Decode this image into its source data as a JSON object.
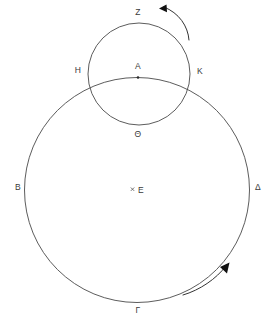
{
  "figure": {
    "background_color": "#ffffff",
    "stroke_color": "#4a4a4a",
    "label_color": "#3a3a3a",
    "arrow_color": "#111111"
  },
  "labels": {
    "z": "Z",
    "a": "A",
    "h": "H",
    "k": "K",
    "theta": "Θ",
    "b": "B",
    "e": "E",
    "delta": "Δ",
    "gamma": "Γ"
  },
  "points": [
    {
      "name": "Z",
      "label": "Z",
      "x": 138,
      "y": 12,
      "marker": "none"
    },
    {
      "name": "A",
      "label": "A",
      "x": 138,
      "y": 66,
      "marker": "dot"
    },
    {
      "name": "H",
      "label": "H",
      "x": 78,
      "y": 70,
      "marker": "none"
    },
    {
      "name": "K",
      "label": "K",
      "x": 200,
      "y": 71,
      "marker": "none"
    },
    {
      "name": "Theta",
      "label": "Θ",
      "x": 138,
      "y": 134,
      "marker": "none"
    },
    {
      "name": "B",
      "label": "B",
      "x": 18,
      "y": 187,
      "marker": "none"
    },
    {
      "name": "E",
      "label": "E",
      "x": 141,
      "y": 190,
      "marker": "cross"
    },
    {
      "name": "Delta",
      "label": "Δ",
      "x": 258,
      "y": 187,
      "marker": "none"
    },
    {
      "name": "Gamma",
      "label": "Γ",
      "x": 138,
      "y": 310,
      "marker": "none"
    }
  ],
  "circles": {
    "large": {
      "name": "large-circle",
      "cx": 137,
      "cy": 190,
      "r": 112.5
    },
    "small": {
      "name": "small-circle",
      "cx": 139,
      "cy": 74,
      "r": 51
    }
  },
  "arrows": [
    {
      "name": "small-circle-rotation-arrow",
      "direction": "counterclockwise",
      "position": "upper-right-outside-small-circle"
    },
    {
      "name": "large-circle-rotation-arrow",
      "direction": "counterclockwise",
      "position": "lower-right-outside-large-circle"
    }
  ]
}
